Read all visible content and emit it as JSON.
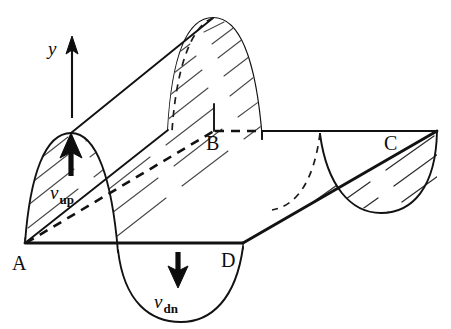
{
  "figure": {
    "background_color": "#ffffff",
    "line_color": "#121212",
    "hatch_color": "#4a4a4a",
    "width": 451,
    "height": 329
  },
  "axis": {
    "label": "y",
    "direction": "up",
    "arrow_name": "y-axis-arrow",
    "x": 72,
    "y_top": 42,
    "y_bottom": 118
  },
  "points": [
    {
      "id": "A",
      "label": "A",
      "x": 12,
      "y": 268,
      "description": "near-left baseline corner"
    },
    {
      "id": "B",
      "label": "B",
      "x": 206,
      "y": 148,
      "description": "far crest baseline junction"
    },
    {
      "id": "C",
      "label": "C",
      "x": 386,
      "y": 148,
      "description": "far-right baseline corner"
    },
    {
      "id": "D",
      "label": "D",
      "x": 224,
      "y": 265,
      "description": "near-right baseline corner"
    }
  ],
  "velocities": [
    {
      "id": "v_up",
      "symbol": "v",
      "subscript": "up",
      "direction": "up",
      "arrow_name": "v-up-arrow",
      "label_x": 56,
      "label_y": 193,
      "arrow_x": 71,
      "arrow_tip_y": 136,
      "arrow_tail_y": 176
    },
    {
      "id": "v_dn",
      "symbol": "v",
      "subscript": "dn",
      "direction": "down",
      "arrow_name": "v-dn-arrow",
      "label_x": 160,
      "label_y": 303,
      "arrow_x": 178,
      "arrow_tip_y": 285,
      "arrow_tail_y": 252
    }
  ],
  "geometry": {
    "crest_label": "upward hump (crest)",
    "trough_label": "downward dip (trough)",
    "baseline_near": "A to D",
    "baseline_far": "B to C",
    "hidden_edges": "dashed"
  }
}
